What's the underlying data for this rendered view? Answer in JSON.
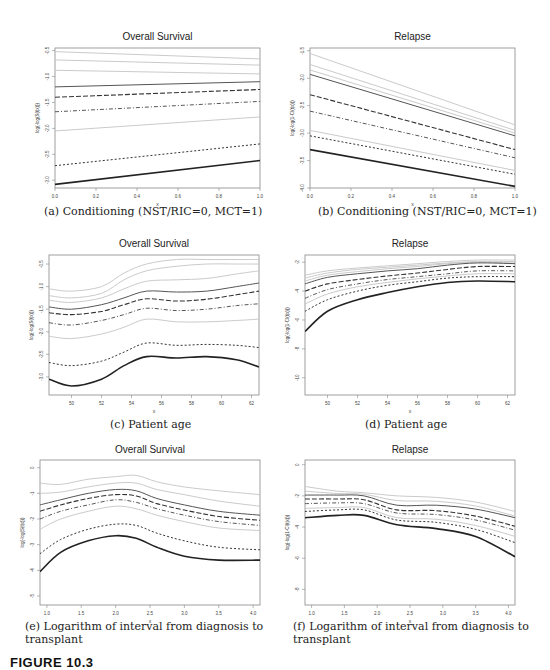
{
  "figure_label": "FIGURE 10.3",
  "chart_data": [
    {
      "id": "a",
      "type": "line",
      "title": "Overall Survival",
      "xlabel": "x",
      "ylabel": "log(-log(S(t|x)))",
      "caption": "(a) Conditioning (NST/RIC=0, MCT=1)",
      "xlim": [
        0.0,
        1.0
      ],
      "ylim": [
        -3.15,
        -0.45
      ],
      "xticks": [
        "0.0",
        "0.2",
        "0.4",
        "0.6",
        "0.8",
        "1.0"
      ],
      "yticks": [
        "-0.5",
        "-1.0",
        "-1.5",
        "-2.0",
        "-2.5",
        "-3.0"
      ],
      "x": [
        0.0,
        1.0
      ],
      "series": [
        {
          "name": "q1",
          "style": "light",
          "values": [
            -0.52,
            -0.66
          ]
        },
        {
          "name": "q2",
          "style": "light",
          "values": [
            -0.68,
            -0.78
          ]
        },
        {
          "name": "q3",
          "style": "light",
          "values": [
            -0.88,
            -0.95
          ]
        },
        {
          "name": "q4",
          "style": "solid",
          "values": [
            -1.2,
            -1.1
          ]
        },
        {
          "name": "q5",
          "style": "longdash",
          "values": [
            -1.4,
            -1.25
          ]
        },
        {
          "name": "q6",
          "style": "dashdot",
          "values": [
            -1.68,
            -1.48
          ]
        },
        {
          "name": "q7",
          "style": "light",
          "values": [
            -2.05,
            -1.78
          ]
        },
        {
          "name": "q8",
          "style": "dotted",
          "values": [
            -2.72,
            -2.3
          ]
        },
        {
          "name": "q9",
          "style": "thick",
          "values": [
            -3.08,
            -2.62
          ]
        }
      ]
    },
    {
      "id": "b",
      "type": "line",
      "title": "Relapse",
      "xlabel": "x",
      "ylabel": "log(-log(1-CI(t|x)))",
      "caption": "(b) Conditioning (NST/RIC=0, MCT=1)",
      "xlim": [
        0.0,
        1.0
      ],
      "ylim": [
        -4.0,
        -1.45
      ],
      "xticks": [
        "0.0",
        "0.2",
        "0.4",
        "0.6",
        "0.8",
        "1.0"
      ],
      "yticks": [
        "-1.5",
        "-2.0",
        "-2.5",
        "-3.0",
        "-3.5",
        "-4.0"
      ],
      "x": [
        0.0,
        1.0
      ],
      "series": [
        {
          "name": "q1",
          "style": "light",
          "values": [
            -1.55,
            -2.85
          ]
        },
        {
          "name": "q2",
          "style": "light",
          "values": [
            -1.75,
            -2.95
          ]
        },
        {
          "name": "q3",
          "style": "light",
          "values": [
            -1.85,
            -3.0
          ]
        },
        {
          "name": "q4",
          "style": "solid",
          "values": [
            -1.93,
            -3.05
          ]
        },
        {
          "name": "q5",
          "style": "longdash",
          "values": [
            -2.3,
            -3.3
          ]
        },
        {
          "name": "q6",
          "style": "dashdot",
          "values": [
            -2.6,
            -3.45
          ]
        },
        {
          "name": "q7",
          "style": "light",
          "values": [
            -2.95,
            -3.68
          ]
        },
        {
          "name": "q8",
          "style": "dotted",
          "values": [
            -3.05,
            -3.75
          ]
        },
        {
          "name": "q9",
          "style": "thick",
          "values": [
            -3.3,
            -3.97
          ]
        }
      ]
    },
    {
      "id": "c",
      "type": "line",
      "title": "Overall Survival",
      "xlabel": "x",
      "ylabel": "log(-log(S(t|x)))",
      "caption": "(c) Patient age",
      "xlim": [
        48.5,
        62.5
      ],
      "ylim": [
        -3.4,
        -0.3
      ],
      "xticks": [
        "50",
        "52",
        "54",
        "56",
        "58",
        "60",
        "62"
      ],
      "yticks": [
        "-0.5",
        "-1.0",
        "-1.5",
        "-2.0",
        "-2.5",
        "-3.0"
      ],
      "x": [
        48.5,
        50,
        52,
        53.5,
        55,
        57,
        59,
        61,
        62.5
      ],
      "series": [
        {
          "name": "q1",
          "style": "light",
          "values": [
            -1.05,
            -1.1,
            -1.0,
            -0.7,
            -0.5,
            -0.4,
            -0.4,
            -0.4,
            -0.4
          ]
        },
        {
          "name": "q2",
          "style": "light",
          "values": [
            -1.2,
            -1.25,
            -1.15,
            -0.85,
            -0.65,
            -0.55,
            -0.5,
            -0.5,
            -0.5
          ]
        },
        {
          "name": "q3",
          "style": "light",
          "values": [
            -1.3,
            -1.35,
            -1.25,
            -1.05,
            -0.88,
            -0.85,
            -0.82,
            -0.72,
            -0.65
          ]
        },
        {
          "name": "q4",
          "style": "solid",
          "values": [
            -1.45,
            -1.5,
            -1.4,
            -1.25,
            -1.1,
            -1.12,
            -1.1,
            -1.0,
            -0.92
          ]
        },
        {
          "name": "q5",
          "style": "longdash",
          "values": [
            -1.58,
            -1.62,
            -1.55,
            -1.4,
            -1.27,
            -1.32,
            -1.28,
            -1.18,
            -1.1
          ]
        },
        {
          "name": "q6",
          "style": "dashdot",
          "values": [
            -1.8,
            -1.85,
            -1.75,
            -1.62,
            -1.48,
            -1.53,
            -1.5,
            -1.42,
            -1.38
          ]
        },
        {
          "name": "q7",
          "style": "light",
          "values": [
            -2.1,
            -2.15,
            -2.05,
            -1.9,
            -1.72,
            -1.78,
            -1.78,
            -1.75,
            -1.72
          ]
        },
        {
          "name": "q8",
          "style": "dotted",
          "values": [
            -2.68,
            -2.75,
            -2.65,
            -2.45,
            -2.25,
            -2.3,
            -2.28,
            -2.3,
            -2.35
          ]
        },
        {
          "name": "q9",
          "style": "thick",
          "values": [
            -3.05,
            -3.2,
            -3.05,
            -2.75,
            -2.55,
            -2.58,
            -2.55,
            -2.62,
            -2.78
          ]
        }
      ]
    },
    {
      "id": "d",
      "type": "line",
      "title": "Relapse",
      "xlabel": "x",
      "ylabel": "log(-log(1-CI(t|x)))",
      "caption": "(d) Patient age",
      "xlim": [
        48.5,
        62.5
      ],
      "ylim": [
        -11.2,
        -1.5
      ],
      "xticks": [
        "50",
        "52",
        "54",
        "56",
        "58",
        "60",
        "62"
      ],
      "yticks": [
        "-2",
        "-4",
        "-6",
        "-8",
        "-10"
      ],
      "x": [
        48.5,
        50,
        52,
        54,
        56,
        58,
        60,
        62.5
      ],
      "series": [
        {
          "name": "q1",
          "style": "light",
          "values": [
            -2.9,
            -2.6,
            -2.4,
            -2.25,
            -2.1,
            -1.95,
            -1.85,
            -1.85
          ]
        },
        {
          "name": "q2",
          "style": "light",
          "values": [
            -3.1,
            -2.75,
            -2.5,
            -2.35,
            -2.2,
            -2.05,
            -1.95,
            -1.95
          ]
        },
        {
          "name": "q3",
          "style": "light",
          "values": [
            -3.3,
            -2.9,
            -2.65,
            -2.45,
            -2.3,
            -2.1,
            -2.0,
            -2.05
          ]
        },
        {
          "name": "q4",
          "style": "solid",
          "values": [
            -3.5,
            -3.05,
            -2.8,
            -2.6,
            -2.45,
            -2.2,
            -2.05,
            -2.1
          ]
        },
        {
          "name": "q5",
          "style": "longdash",
          "values": [
            -4.0,
            -3.5,
            -3.2,
            -2.95,
            -2.75,
            -2.5,
            -2.3,
            -2.3
          ]
        },
        {
          "name": "q6",
          "style": "dashdot",
          "values": [
            -4.5,
            -3.9,
            -3.5,
            -3.2,
            -3.0,
            -2.8,
            -2.6,
            -2.6
          ]
        },
        {
          "name": "q7",
          "style": "light",
          "values": [
            -4.9,
            -4.2,
            -3.7,
            -3.4,
            -3.15,
            -2.95,
            -2.8,
            -2.8
          ]
        },
        {
          "name": "q8",
          "style": "dotted",
          "values": [
            -5.4,
            -4.6,
            -4.0,
            -3.6,
            -3.35,
            -3.1,
            -3.0,
            -3.0
          ]
        },
        {
          "name": "q9",
          "style": "thick",
          "values": [
            -6.8,
            -5.4,
            -4.6,
            -4.1,
            -3.7,
            -3.4,
            -3.3,
            -3.35
          ]
        }
      ]
    },
    {
      "id": "e",
      "type": "line",
      "title": "Overall Survival",
      "xlabel": "x",
      "ylabel": "log(-log(S(t|x)))",
      "caption": "(e) Logarithm of interval from diagnosis to transplant",
      "xlim": [
        0.9,
        4.1
      ],
      "ylim": [
        -5.35,
        0.3
      ],
      "xticks": [
        "1.0",
        "1.5",
        "2.0",
        "2.5",
        "3.0",
        "3.5",
        "4.0"
      ],
      "yticks": [
        "0",
        "-1",
        "-2",
        "-3",
        "-4",
        "-5"
      ],
      "x": [
        0.9,
        1.2,
        1.6,
        2.0,
        2.3,
        2.6,
        3.0,
        3.5,
        4.1
      ],
      "series": [
        {
          "name": "q1",
          "style": "light",
          "values": [
            -0.6,
            -0.65,
            -0.45,
            -0.35,
            -0.3,
            -0.55,
            -0.75,
            -0.9,
            -1.05
          ]
        },
        {
          "name": "q2",
          "style": "light",
          "values": [
            -1.0,
            -0.95,
            -0.75,
            -0.6,
            -0.6,
            -0.85,
            -1.05,
            -1.3,
            -1.5
          ]
        },
        {
          "name": "q3",
          "style": "solid",
          "values": [
            -1.45,
            -1.25,
            -1.0,
            -0.85,
            -0.9,
            -1.2,
            -1.45,
            -1.7,
            -1.85
          ]
        },
        {
          "name": "q4",
          "style": "longdash",
          "values": [
            -1.7,
            -1.45,
            -1.2,
            -1.05,
            -1.1,
            -1.4,
            -1.65,
            -1.9,
            -2.05
          ]
        },
        {
          "name": "q5",
          "style": "dashdot",
          "values": [
            -2.0,
            -1.7,
            -1.45,
            -1.25,
            -1.35,
            -1.6,
            -1.85,
            -2.1,
            -2.25
          ]
        },
        {
          "name": "q6",
          "style": "light",
          "values": [
            -2.4,
            -2.0,
            -1.7,
            -1.5,
            -1.6,
            -1.85,
            -2.1,
            -2.35,
            -2.45
          ]
        },
        {
          "name": "q7",
          "style": "dotted",
          "values": [
            -3.35,
            -2.8,
            -2.4,
            -2.2,
            -2.25,
            -2.55,
            -2.85,
            -3.1,
            -3.2
          ]
        },
        {
          "name": "q8",
          "style": "thick",
          "values": [
            -4.05,
            -3.3,
            -2.85,
            -2.65,
            -2.75,
            -3.1,
            -3.45,
            -3.6,
            -3.6
          ]
        }
      ]
    },
    {
      "id": "f",
      "type": "line",
      "title": "Relapse",
      "xlabel": "x",
      "ylabel": "log(-log(1-CI(t|x)))",
      "caption": "(f) Logarithm of interval from diagnosis to transplant",
      "xlim": [
        0.9,
        4.1
      ],
      "ylim": [
        -9.0,
        0.3
      ],
      "xticks": [
        "1.0",
        "1.5",
        "2.0",
        "2.5",
        "3.0",
        "3.5",
        "4.0"
      ],
      "yticks": [
        "0",
        "-2",
        "-4",
        "-6",
        "-8"
      ],
      "x": [
        0.9,
        1.4,
        1.8,
        2.3,
        2.9,
        3.5,
        4.1
      ],
      "series": [
        {
          "name": "q1",
          "style": "light",
          "values": [
            -1.4,
            -1.7,
            -1.8,
            -2.0,
            -2.1,
            -2.4,
            -3.0
          ]
        },
        {
          "name": "q2",
          "style": "light",
          "values": [
            -1.7,
            -1.85,
            -1.9,
            -2.3,
            -2.35,
            -2.65,
            -3.3
          ]
        },
        {
          "name": "q3",
          "style": "solid",
          "values": [
            -1.95,
            -1.95,
            -2.0,
            -2.6,
            -2.6,
            -2.85,
            -3.4
          ]
        },
        {
          "name": "q4",
          "style": "longdash",
          "values": [
            -2.2,
            -2.2,
            -2.25,
            -2.9,
            -2.95,
            -3.3,
            -3.95
          ]
        },
        {
          "name": "q5",
          "style": "dashdot",
          "values": [
            -2.5,
            -2.45,
            -2.5,
            -3.1,
            -3.2,
            -3.55,
            -4.2
          ]
        },
        {
          "name": "q6",
          "style": "light",
          "values": [
            -2.8,
            -2.75,
            -2.75,
            -3.4,
            -3.5,
            -3.9,
            -4.6
          ]
        },
        {
          "name": "q7",
          "style": "dotted",
          "values": [
            -3.0,
            -2.9,
            -2.9,
            -3.55,
            -3.7,
            -4.15,
            -5.0
          ]
        },
        {
          "name": "q8",
          "style": "thick",
          "values": [
            -3.4,
            -3.25,
            -3.25,
            -3.85,
            -4.1,
            -4.6,
            -5.9
          ]
        }
      ]
    }
  ]
}
